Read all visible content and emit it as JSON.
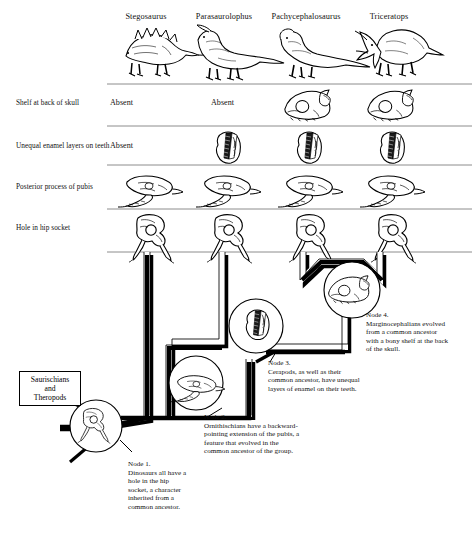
{
  "figure": {
    "type": "cladogram-character-matrix",
    "title_visible": false
  },
  "columns": [
    {
      "id": "stegosaurus",
      "label": "Stegosaurus",
      "x": 146
    },
    {
      "id": "parasaurolophus",
      "label": "Parasaurolophus",
      "x": 223
    },
    {
      "id": "pachycephalosaurus",
      "label": "Pachycephalosaurus",
      "x": 305
    },
    {
      "id": "triceratops",
      "label": "Triceratops",
      "x": 388
    }
  ],
  "rows": [
    {
      "id": "shelf-at-back-of-skull",
      "label": "Shelf at back of skull",
      "cells": [
        {
          "kind": "text",
          "value": "Absent"
        },
        {
          "kind": "text",
          "value": "Absent"
        },
        {
          "kind": "icon",
          "value": "skull-shelf-icon"
        },
        {
          "kind": "icon",
          "value": "skull-shelf-icon"
        }
      ]
    },
    {
      "id": "unequal-enamel-layers-on-teeth",
      "label": "Unequal enamel layers on teeth",
      "cells": [
        {
          "kind": "text",
          "value": "Absent"
        },
        {
          "kind": "icon",
          "value": "tooth-enamel-icon"
        },
        {
          "kind": "icon",
          "value": "tooth-enamel-icon"
        },
        {
          "kind": "icon",
          "value": "tooth-enamel-icon"
        }
      ]
    },
    {
      "id": "posterior-process-of-pubis",
      "label": "Posterior process of pubis",
      "cells": [
        {
          "kind": "icon",
          "value": "pubis-icon"
        },
        {
          "kind": "icon",
          "value": "pubis-icon"
        },
        {
          "kind": "icon",
          "value": "pubis-icon"
        },
        {
          "kind": "icon",
          "value": "pubis-icon"
        }
      ]
    },
    {
      "id": "hole-in-hip-socket",
      "label": "Hole in hip socket",
      "cells": [
        {
          "kind": "icon",
          "value": "hip-socket-icon"
        },
        {
          "kind": "icon",
          "value": "hip-socket-icon"
        },
        {
          "kind": "icon",
          "value": "hip-socket-icon"
        },
        {
          "kind": "icon",
          "value": "hip-socket-icon"
        }
      ]
    }
  ],
  "outgroup": {
    "line1": "Saurischians",
    "line2": "and",
    "line3": "Theropods"
  },
  "nodes": [
    {
      "id": "node-1",
      "heading": "Node 1.",
      "icon": "hip-socket-icon",
      "lines": [
        "Dinosaurs all have a",
        "hole in the hip",
        "socket, a character",
        "inherited from a",
        "common ancestor."
      ]
    },
    {
      "id": "node-2",
      "heading": "Node 2.",
      "icon": "pubis-icon",
      "lines": [
        "Ornithischians have a backward-",
        "pointing extension of the pubis, a",
        "feature that evolved in the",
        "common ancestor of the group."
      ]
    },
    {
      "id": "node-3",
      "heading": "Node 3.",
      "icon": "tooth-enamel-icon",
      "lines": [
        "Cerapods, as well as their",
        "common ancestor, have unequal",
        "layers of enamel on their teeth."
      ]
    },
    {
      "id": "node-4",
      "heading": "Node 4.",
      "icon": "skull-shelf-icon",
      "lines": [
        "Marginocephalians evolved",
        "from a common ancestor",
        "with a bony shelf at the back",
        "of the skull."
      ]
    }
  ],
  "colors": {
    "ink": "#000000",
    "background": "#ffffff",
    "rule": "#8a8a8a",
    "branch_fill": "#ffffff",
    "branch_shadow": "#000000"
  }
}
